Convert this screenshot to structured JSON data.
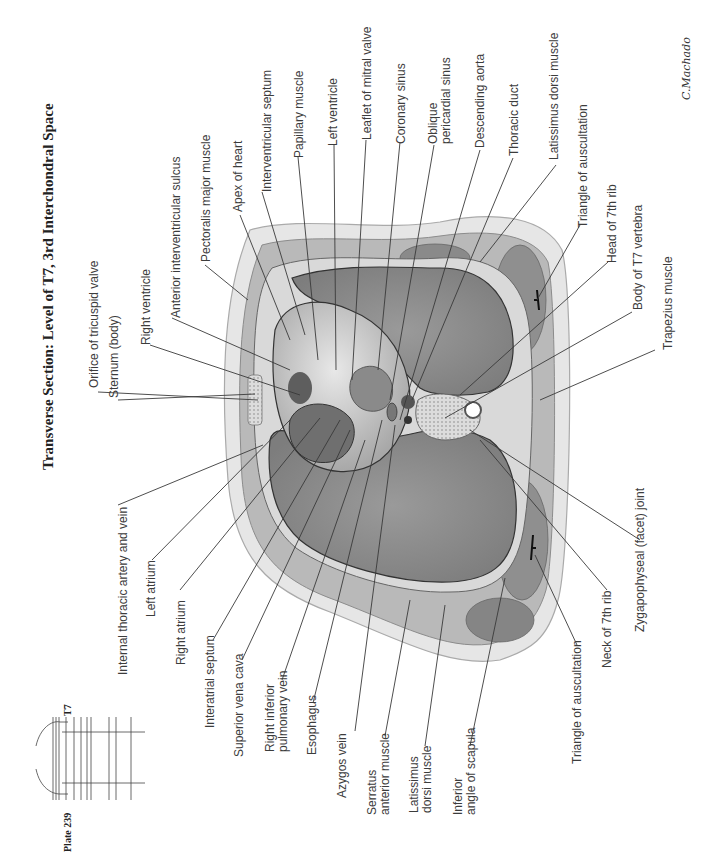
{
  "plate": {
    "number_label": "Plate 239",
    "level_marker": "T7",
    "title": "Transverse Section: Level of T7, 3rd Interchondral Space",
    "signature": "C.Machado"
  },
  "labels_anterior_side": [
    "Orifice of tricuspid valve",
    "Sternum (body)",
    "Right ventricle",
    "Anterior interventricular sulcus",
    "Pectoralis major muscle",
    "Apex of heart",
    "Interventricular septum",
    "Papillary muscle",
    "Left ventricle",
    "Leaflet of mitral valve",
    "Coronary sinus",
    "Oblique pericardial sinus",
    "Descending aorta",
    "Thoracic duct",
    "Latissimus dorsi muscle",
    "Triangle of auscultation",
    "Head of 7th rib",
    "Body of T7 vertebra",
    "Trapezius muscle"
  ],
  "labels": {
    "orifice_tricuspid": "Orifice of tricuspid valve",
    "sternum": "Sternum (body)",
    "right_ventricle": "Right ventricle",
    "ant_iv_sulcus": "Anterior interventricular sulcus",
    "pectoralis": "Pectoralis major muscle",
    "apex": "Apex of heart",
    "iv_septum": "Interventricular septum",
    "papillary": "Papillary muscle",
    "left_ventricle": "Left ventricle",
    "mitral_leaflet": "Leaflet of mitral valve",
    "coronary_sinus": "Coronary sinus",
    "oblique_l1": "Oblique",
    "oblique_l2": "pericardial sinus",
    "desc_aorta": "Descending aorta",
    "thoracic_duct": "Thoracic duct",
    "latissimus_top": "Latissimus dorsi muscle",
    "triangle_top": "Triangle of auscultation",
    "head_7th_rib": "Head of 7th rib",
    "body_t7": "Body of T7 vertebra",
    "trapezius": "Trapezius muscle",
    "int_thoracic": "Internal thoracic artery and vein",
    "left_atrium": "Left atrium",
    "right_atrium": "Right atrium",
    "interatrial": "Interatrial septum",
    "svc": "Superior vena cava",
    "rip_l1": "Right inferior",
    "rip_l2": "pulmonary vein",
    "esophagus": "Esophagus",
    "azygos": "Azygos vein",
    "serratus_l1": "Serratus",
    "serratus_l2": "anterior muscle",
    "latissimus_l1": "Latissimus",
    "latissimus_l2": "dorsi muscle",
    "inf_angle_l1": "Inferior",
    "inf_angle_l2": "angle of scapula",
    "triangle_bottom": "Triangle of auscultation",
    "neck_7th_rib": "Neck of 7th rib",
    "zygapophyseal": "Zygapophyseal (facet) joint"
  },
  "colors": {
    "lung": "#8a8a8a",
    "muscle": "#9a9a9a",
    "fat": "#e4e4e4",
    "skin": "#d2d2d2",
    "heart": "#bdbdbd",
    "leader": "#3a3a3a"
  }
}
